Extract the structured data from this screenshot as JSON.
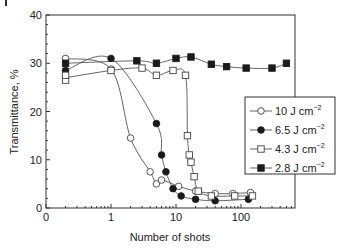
{
  "chart_data": {
    "type": "line",
    "title": "",
    "xlabel": "Number of shots",
    "ylabel": "Transmittance, %",
    "xscale": "log",
    "xlim": [
      0.1,
      700
    ],
    "ylim": [
      0,
      40
    ],
    "x_tick_labels": [
      "0",
      "1",
      "10",
      "100"
    ],
    "x_tick_values": [
      0.1,
      1,
      10,
      100
    ],
    "y_ticks": [
      0,
      10,
      20,
      30,
      40
    ],
    "grid": false,
    "legend_position": "right-middle inside",
    "series": [
      {
        "name": "10 J cm-2",
        "label_main": "10 J cm",
        "label_sup": "−2",
        "marker": "open-circle",
        "x": [
          0.2,
          1,
          2,
          4,
          5,
          6,
          11,
          20,
          40,
          75,
          140
        ],
        "y": [
          31,
          28.8,
          14.5,
          7.5,
          5,
          5.8,
          4.5,
          3.5,
          3,
          3,
          3.2
        ]
      },
      {
        "name": "6.5 J cm-2",
        "label_main": "6.5 J cm",
        "label_sup": "−2",
        "marker": "filled-circle",
        "x": [
          0.2,
          1,
          5,
          6,
          7,
          9,
          12,
          20,
          40,
          130
        ],
        "y": [
          28.5,
          31,
          17.5,
          11,
          7.5,
          4,
          2.5,
          1.8,
          1.5,
          1.8
        ]
      },
      {
        "name": "4.3 J cm-2",
        "label_main": "4.3 J cm",
        "label_sup": "−2",
        "marker": "open-square",
        "x": [
          0.2,
          0.2,
          1,
          3,
          5,
          9,
          14,
          15,
          16,
          17,
          19,
          22,
          35,
          80,
          150
        ],
        "y": [
          26.5,
          27.5,
          28.5,
          29,
          27.5,
          28.5,
          27.5,
          15,
          11,
          9.5,
          6.5,
          3.5,
          2.5,
          2.5,
          2.5
        ]
      },
      {
        "name": "2.8 J cm-2",
        "label_main": "2.8 J cm",
        "label_sup": "−2",
        "marker": "filled-square",
        "x": [
          0.2,
          2.5,
          5,
          10,
          17,
          35,
          60,
          120,
          300,
          500
        ],
        "y": [
          30,
          30.5,
          30,
          31,
          31.3,
          29.8,
          29.3,
          29,
          29,
          30
        ]
      }
    ]
  },
  "colors": {
    "axis": "#333333",
    "line": "#555555",
    "marker_fill_dark": "#1a1a1a",
    "marker_fill_light": "#ffffff"
  }
}
